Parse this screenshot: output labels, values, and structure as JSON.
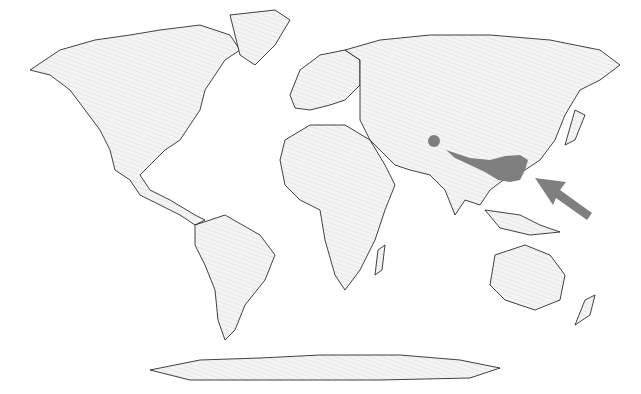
{
  "map": {
    "type": "world outline map",
    "land_fill": "#f0f0f0",
    "outline_color": "#000000",
    "highlight_color": "#808080",
    "highlight_region": "southern China (Yangtze basin) plus a small patch on the Tibetan plateau",
    "arrow": {
      "direction": "pointing northwest toward the south China coast",
      "color": "#808080"
    }
  }
}
